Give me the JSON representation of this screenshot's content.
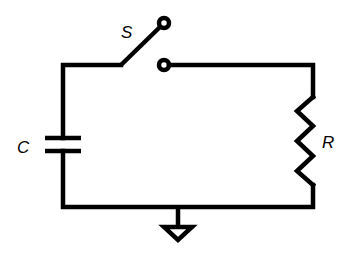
{
  "diagram": {
    "type": "circuit",
    "stroke_color": "#000000",
    "background": "#ffffff",
    "components": [
      {
        "id": "switch",
        "label": "S",
        "kind": "switch",
        "state": "open"
      },
      {
        "id": "capacitor",
        "label": "C",
        "kind": "capacitor"
      },
      {
        "id": "resistor",
        "label": "R",
        "kind": "resistor"
      },
      {
        "id": "ground",
        "label": "",
        "kind": "ground"
      }
    ],
    "labels": {
      "switch": "S",
      "capacitor": "C",
      "resistor": "R"
    }
  }
}
